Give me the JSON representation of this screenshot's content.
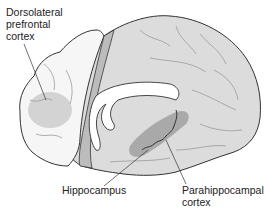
{
  "diagram": {
    "colors": {
      "background": "#ffffff",
      "frontal_surface": "#f6f6f6",
      "cortex_fill": "#dcdcdc",
      "cut_plane": "#bcbcbc",
      "dlpfc_region": "#cfcfcf",
      "parahippocampal_region": "#a9a9a9",
      "hippocampus": "#8f8f8f",
      "ventricle": "#ffffff",
      "outline": "#333333",
      "sulci": "#9a9a9a",
      "leader_line": "#333333"
    },
    "labels": {
      "dlpfc": "Dorsolateral\nprefrontal\ncortex",
      "hippocampus": "Hippocampus",
      "parahippocampal": "Parahippocampal\ncortex"
    }
  }
}
